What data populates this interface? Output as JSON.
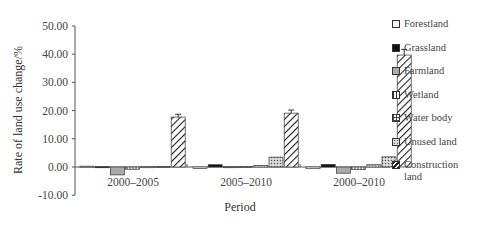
{
  "chart_data": {
    "type": "bar",
    "title": "",
    "xlabel": "Period",
    "ylabel": "Rate of land use change/%",
    "ylim": [
      -10,
      50
    ],
    "yticks": [
      "50.00",
      "40.00",
      "30.00",
      "20.00",
      "10.00",
      "0.00",
      "-10.00"
    ],
    "grid": false,
    "legend_position": "right",
    "categories": [
      "2000–2005",
      "2005–2010",
      "2000–2010"
    ],
    "series": [
      {
        "name": "Forestland",
        "pattern": "white",
        "values": [
          0.3,
          -0.5,
          -0.6
        ]
      },
      {
        "name": "Grassland",
        "pattern": "black",
        "values": [
          0.1,
          0.8,
          0.9
        ]
      },
      {
        "name": "Farmland",
        "pattern": "gray",
        "values": [
          -2.8,
          0.1,
          -2.2
        ]
      },
      {
        "name": "Wetland",
        "pattern": "vertical-lines",
        "values": [
          -0.8,
          0.2,
          -0.9
        ]
      },
      {
        "name": "Water body",
        "pattern": "grid",
        "values": [
          0.1,
          0.5,
          0.8
        ]
      },
      {
        "name": "Unused land",
        "pattern": "dots",
        "values": [
          0.2,
          3.5,
          3.6
        ]
      },
      {
        "name": "Construction land",
        "pattern": "diagonal",
        "values": [
          17.7,
          19.1,
          39.7
        ]
      }
    ],
    "error_bars": [
      [
        0,
        0,
        0,
        0,
        0,
        0,
        1.0
      ],
      [
        0,
        0,
        0,
        0,
        0,
        0,
        1.1
      ],
      [
        0,
        0,
        0,
        0,
        0,
        0,
        2.0
      ]
    ]
  },
  "legend": {
    "items": [
      {
        "label": "Forestland"
      },
      {
        "label": "Grassland"
      },
      {
        "label": "Farmland"
      },
      {
        "label": "Wetland"
      },
      {
        "label": "Water body"
      },
      {
        "label": "Unused land"
      },
      {
        "label": "Construction",
        "label2": "land"
      }
    ]
  }
}
